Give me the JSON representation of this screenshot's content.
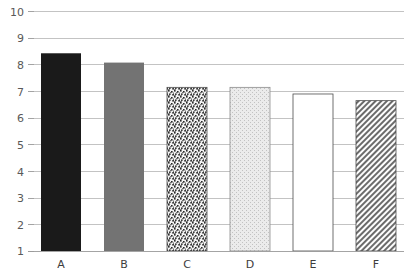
{
  "chart_data": {
    "type": "bar",
    "title": "",
    "subtitle": "",
    "xlabel": "",
    "ylabel": "",
    "categories": [
      "A",
      "B",
      "C",
      "D",
      "E",
      "F"
    ],
    "values": [
      8.43,
      8.08,
      7.15,
      7.15,
      6.9,
      6.65
    ],
    "series": [
      {
        "name": "",
        "values": [
          8.43,
          8.08,
          7.15,
          7.15,
          6.9,
          6.65
        ]
      }
    ],
    "ylim": [
      1,
      10
    ],
    "xlim_categories": 6,
    "yticks": [
      1,
      2,
      3,
      4,
      5,
      6,
      7,
      8,
      9,
      10
    ],
    "ytick_labels": [
      "1",
      "2",
      "3",
      "4",
      "5",
      "6",
      "7",
      "8",
      "9",
      "10"
    ],
    "xtick_labels": [
      "A",
      "B",
      "C",
      "D",
      "E",
      "F"
    ],
    "grid": "horizontal",
    "grid_color": "#b4b4b4",
    "legend": "none",
    "legend_position": "none",
    "annotations": [],
    "bar_styles": [
      {
        "category": "A",
        "fill": "solid",
        "color": "#1a1a1a",
        "outline": "none"
      },
      {
        "category": "B",
        "fill": "solid",
        "color": "#737373",
        "outline": "none"
      },
      {
        "category": "C",
        "fill": "speckle-coarse",
        "color": "#4a4a4a",
        "outline": "#4d4d4d"
      },
      {
        "category": "D",
        "fill": "stipple-light",
        "color": "#d9d9d9",
        "outline": "#8c8c8c"
      },
      {
        "category": "E",
        "fill": "empty",
        "color": "#ffffff",
        "outline": "#4d4d4d"
      },
      {
        "category": "F",
        "fill": "diagonal-hatch",
        "color": "#6b6b6b",
        "outline": "#4d4d4d"
      }
    ]
  },
  "axes": {
    "y_axis_label": "",
    "x_axis_label": "",
    "y_min_label": "1",
    "y_max_label": "10"
  }
}
